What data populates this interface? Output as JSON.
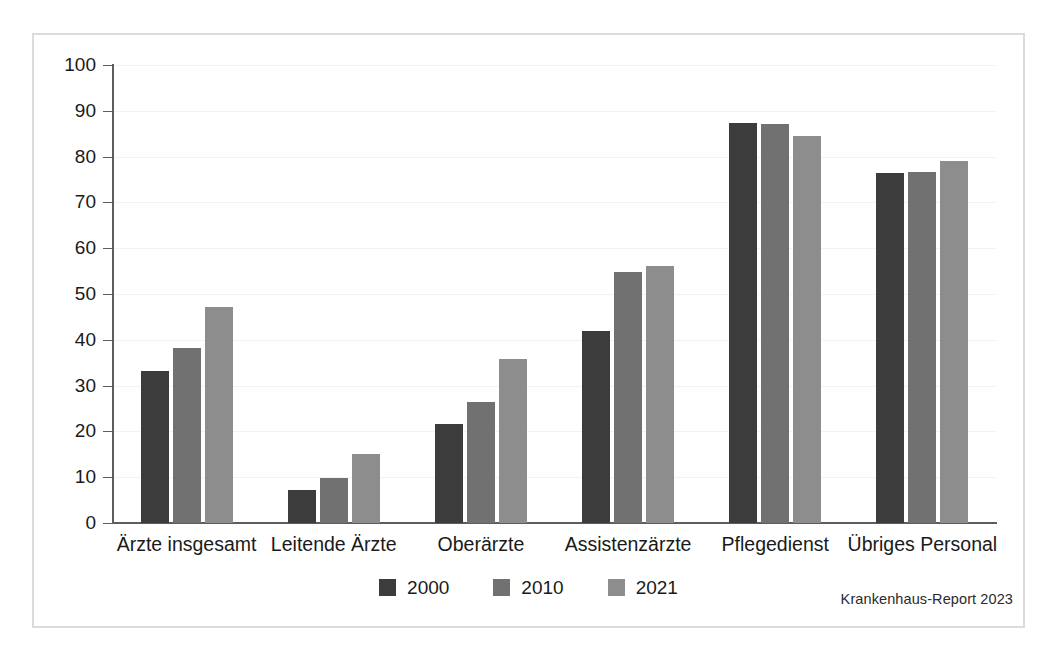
{
  "chart_data": {
    "type": "bar",
    "title": "",
    "xlabel": "",
    "ylabel": "",
    "ylim": [
      0,
      100
    ],
    "yticks": [
      0,
      10,
      20,
      30,
      40,
      50,
      60,
      70,
      80,
      90,
      100
    ],
    "ytick_labels": [
      "0",
      "10",
      "20",
      "30",
      "40",
      "50",
      "60",
      "70",
      "80",
      "90",
      "100"
    ],
    "grid": true,
    "legend_position": "bottom-center",
    "categories": [
      "Ärzte insgesamt",
      "Leitende Ärzte",
      "Oberärzte",
      "Assistenzärzte",
      "Pflegedienst",
      "Übriges Personal"
    ],
    "series": [
      {
        "name": "2000",
        "color": "#3c3c3c",
        "values": [
          33.2,
          7.1,
          21.6,
          42.0,
          87.4,
          76.5
        ]
      },
      {
        "name": "2010",
        "color": "#717171",
        "values": [
          38.3,
          9.8,
          26.4,
          54.8,
          87.1,
          76.6
        ]
      },
      {
        "name": "2021",
        "color": "#8d8d8d",
        "values": [
          47.1,
          15.1,
          35.8,
          56.2,
          84.6,
          79.0
        ]
      }
    ],
    "source": "Krankenhaus-Report 2023"
  },
  "legend": {
    "items": [
      {
        "label": "2000"
      },
      {
        "label": "2010"
      },
      {
        "label": "2021"
      }
    ]
  },
  "source_note": "Krankenhaus-Report 2023"
}
